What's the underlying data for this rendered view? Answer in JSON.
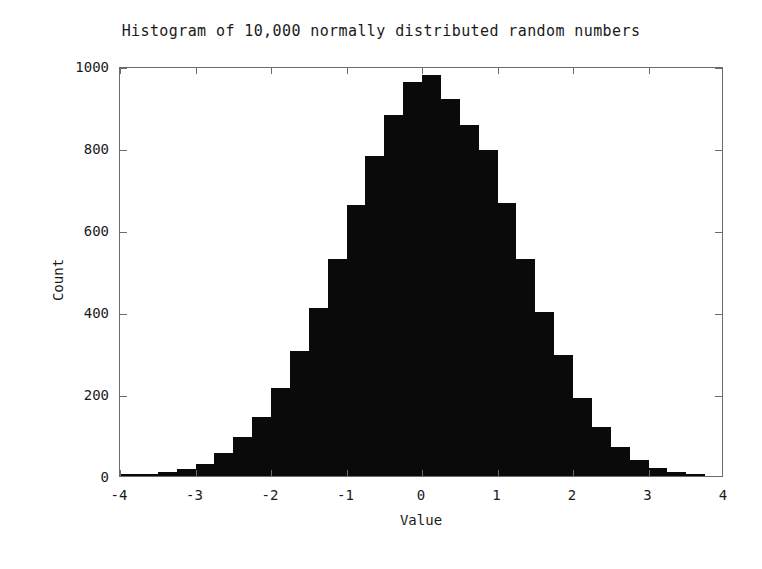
{
  "chart_data": {
    "type": "bar",
    "title": "Histogram of 10,000 normally distributed random numbers",
    "xlabel": "Value",
    "ylabel": "Count",
    "xlim": [
      -4,
      4
    ],
    "ylim": [
      0,
      1000
    ],
    "xticks": [
      -4,
      -3,
      -2,
      -1,
      0,
      1,
      2,
      3,
      4
    ],
    "xticklabels": [
      "-4",
      "-3",
      "-2",
      "-1",
      "0",
      "1",
      "2",
      "3",
      "4"
    ],
    "yticks": [
      0,
      200,
      400,
      600,
      800,
      1000
    ],
    "yticklabels": [
      "0",
      "200",
      "400",
      "600",
      "800",
      "1000"
    ],
    "grid": false,
    "legend": null,
    "bar_color": "#0a0a0a",
    "bin_width": 0.25,
    "n_samples": 10000,
    "bin_edges": [
      -4.0,
      -3.75,
      -3.5,
      -3.25,
      -3.0,
      -2.75,
      -2.5,
      -2.25,
      -2.0,
      -1.75,
      -1.5,
      -1.25,
      -1.0,
      -0.75,
      -0.5,
      -0.25,
      0.0,
      0.25,
      0.5,
      0.75,
      1.0,
      1.25,
      1.5,
      1.75,
      2.0,
      2.25,
      2.5,
      2.75,
      3.0,
      3.25,
      3.5,
      3.75
    ],
    "bin_centers": [
      -3.875,
      -3.625,
      -3.375,
      -3.125,
      -2.875,
      -2.625,
      -2.375,
      -2.125,
      -1.875,
      -1.625,
      -1.375,
      -1.125,
      -0.875,
      -0.625,
      -0.375,
      -0.125,
      0.125,
      0.375,
      0.625,
      0.875,
      1.125,
      1.375,
      1.625,
      1.875,
      2.125,
      2.375,
      2.625,
      2.875,
      3.125,
      3.375,
      3.625,
      3.875
    ],
    "categories": [
      "-3.875",
      "-3.625",
      "-3.375",
      "-3.125",
      "-2.875",
      "-2.625",
      "-2.375",
      "-2.125",
      "-1.875",
      "-1.625",
      "-1.375",
      "-1.125",
      "-0.875",
      "-0.625",
      "-0.375",
      "-0.125",
      "0.125",
      "0.375",
      "0.625",
      "0.875",
      "1.125",
      "1.375",
      "1.625",
      "1.875",
      "2.125",
      "2.375",
      "2.625",
      "2.875",
      "3.125",
      "3.375",
      "3.625",
      "3.875"
    ],
    "values": [
      4,
      6,
      10,
      18,
      30,
      55,
      95,
      145,
      215,
      305,
      410,
      530,
      660,
      780,
      880,
      960,
      978,
      920,
      855,
      795,
      665,
      530,
      400,
      295,
      190,
      120,
      70,
      38,
      20,
      10,
      6,
      0
    ]
  },
  "figure": {
    "width": 762,
    "height": 569,
    "background": "#ffffff",
    "frame_color": "#6b6b6b",
    "text_color": "#1a1a1a"
  }
}
